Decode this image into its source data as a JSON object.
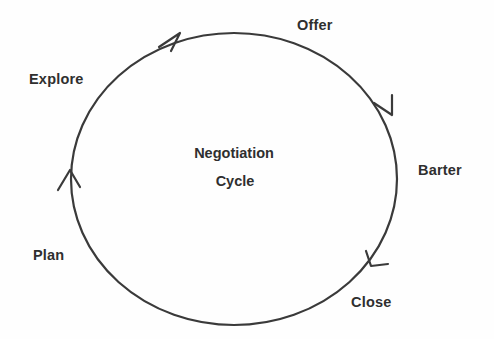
{
  "diagram": {
    "title": "Negotiation Cycle",
    "type": "cycle",
    "direction": "clockwise",
    "center": {
      "line1": "Negotiation",
      "line2": "Cycle"
    },
    "colors": {
      "background": "#fefefe",
      "stroke": "#3a3a3a",
      "text": "#2f2f2f"
    },
    "ellipse": {
      "cx": 234,
      "cy": 179,
      "rx": 163,
      "ry": 146,
      "stroke_width": 2.2
    },
    "stages": [
      {
        "id": "offer",
        "label": "Offer",
        "position": "top-right"
      },
      {
        "id": "barter",
        "label": "Barter",
        "position": "right"
      },
      {
        "id": "close",
        "label": "Close",
        "position": "bottom-right"
      },
      {
        "id": "plan",
        "label": "Plan",
        "position": "bottom-left"
      },
      {
        "id": "explore",
        "label": "Explore",
        "position": "top-left"
      }
    ],
    "arrows": [
      {
        "id": "arrow-to-offer",
        "angle_deg": 237,
        "points": "clockwise"
      },
      {
        "id": "arrow-to-barter",
        "angle_deg": 330,
        "points": "clockwise"
      },
      {
        "id": "arrow-to-close",
        "angle_deg": 33,
        "points": "clockwise"
      },
      {
        "id": "arrow-to-explore",
        "angle_deg": 178,
        "points": "clockwise"
      }
    ]
  }
}
